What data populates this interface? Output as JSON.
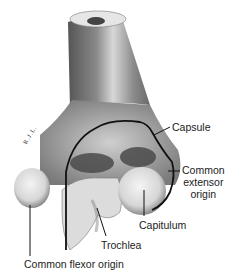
{
  "figure": {
    "signature": "R.J.L.",
    "labels": {
      "capsule": "Capsule",
      "common_extensor_origin": [
        "Common",
        "extensor",
        "origin"
      ],
      "capitulum": "Capitulum",
      "trochlea": "Trochlea",
      "common_flexor_origin": "Common flexor origin"
    },
    "colors": {
      "background": "#ffffff",
      "bone_light": "#e8e8e8",
      "bone_shade": "#6a6a6a",
      "outline": "#111111",
      "text": "#222222"
    }
  }
}
